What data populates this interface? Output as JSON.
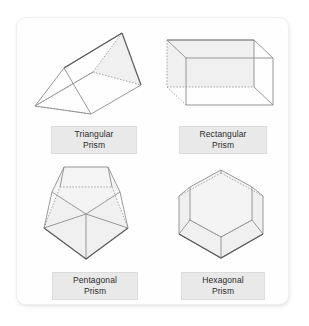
{
  "page": {
    "background_color": "#ffffff",
    "card_color": "#fefefe",
    "card_border_color": "#f0f0f0",
    "label_plate_color": "#e9e9e9",
    "label_plate_border_color": "#dcdcdc",
    "label_text_color": "#2b2b2b",
    "edge_visible_color": "#8d8d8d",
    "edge_hidden_color": "#9a9a9a",
    "face_fill_color": "#ededed"
  },
  "figures": [
    {
      "id": "triangular-prism",
      "name": "Triangular Prism",
      "label_line1": "Triangular",
      "label_line2": "Prism",
      "faces": 5,
      "edges": 9,
      "vertices": 6,
      "base_shape": "triangle",
      "base_sides": 3,
      "orientation": "oblique, long axis tilted up to the right"
    },
    {
      "id": "rectangular-prism",
      "name": "Rectangular Prism",
      "label_line1": "Rectangular",
      "label_line2": "Prism",
      "faces": 6,
      "edges": 12,
      "vertices": 8,
      "base_shape": "rectangle",
      "base_sides": 4,
      "orientation": "oblique, viewed from front-left"
    },
    {
      "id": "pentagonal-prism",
      "name": "Pentagonal Prism",
      "label_line1": "Pentagonal",
      "label_line2": "Prism",
      "faces": 7,
      "edges": 15,
      "vertices": 10,
      "base_shape": "pentagon",
      "base_sides": 5,
      "orientation": "upright, viewed from above"
    },
    {
      "id": "hexagonal-prism",
      "name": "Hexagonal Prism",
      "label_line1": "Hexagonal",
      "label_line2": "Prism",
      "faces": 8,
      "edges": 18,
      "vertices": 12,
      "base_shape": "hexagon",
      "base_sides": 6,
      "orientation": "upright, viewed from above"
    }
  ]
}
